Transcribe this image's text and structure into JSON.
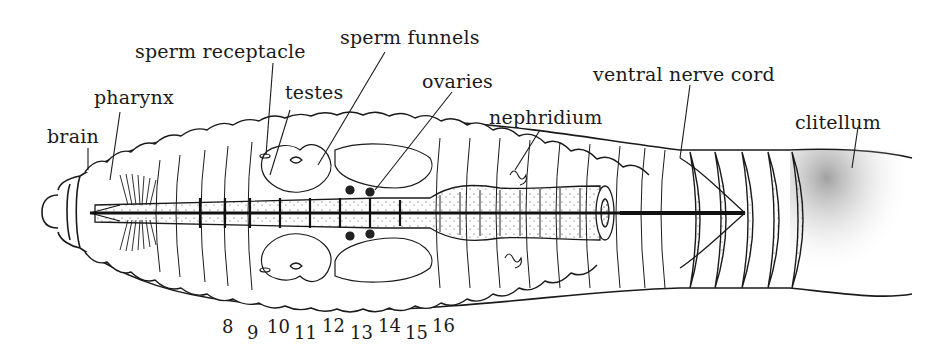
{
  "figure": {
    "ink_color": "#1a1a1a",
    "background": "#ffffff"
  },
  "labels": {
    "brain": "brain",
    "pharynx": "pharynx",
    "sperm_receptacle": "sperm receptacle",
    "testes": "testes",
    "sperm_funnels": "sperm funnels",
    "ovaries": "ovaries",
    "nephridium": "nephridium",
    "ventral_nerve_cord": "ventral nerve cord",
    "clitellum": "clitellum"
  },
  "segments": [
    "8",
    "9",
    "10",
    "11",
    "12",
    "13",
    "14",
    "15",
    "16"
  ]
}
